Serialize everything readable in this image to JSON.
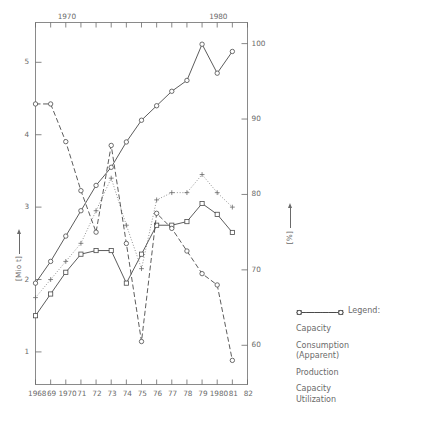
{
  "chart_data": {
    "type": "line",
    "title": "",
    "xlabel": "",
    "ylabel": "[Mio t]",
    "y2label": "[%]",
    "grid": false,
    "legend_position": "right-bottom",
    "legend_title": "Legend:",
    "x": [
      1968,
      1969,
      1970,
      1971,
      1972,
      1973,
      1974,
      1975,
      1976,
      1977,
      1978,
      1979,
      1980,
      1981,
      1982
    ],
    "xtick_labels": [
      "1968",
      "69",
      "1970",
      "71",
      "72",
      "73",
      "74",
      "75",
      "76",
      "77",
      "78",
      "79",
      "1980",
      "81",
      "82"
    ],
    "xtick_labels_top": [
      "",
      "",
      "1970",
      "",
      "",
      "",
      "",
      "",
      "",
      "",
      "",
      "",
      "1980",
      "",
      ""
    ],
    "ylim": [
      0.55,
      5.55
    ],
    "ytick_labels": [
      "1",
      "2",
      "3",
      "4",
      "5"
    ],
    "ytick_values": [
      1,
      2,
      3,
      4,
      5
    ],
    "y2lim": [
      54.8,
      102.8
    ],
    "y2tick_labels": [
      "60",
      "70",
      "80",
      "90",
      "100"
    ],
    "y2tick_values": [
      60,
      70,
      80,
      90,
      100
    ],
    "series": [
      {
        "name": "Capacity",
        "axis": "left",
        "marker": "circle",
        "line": "solid",
        "color": "#4a4a4a",
        "x": [
          1968,
          1969,
          1970,
          1971,
          1972,
          1973,
          1974,
          1975,
          1976,
          1977,
          1978,
          1979,
          1980,
          1981
        ],
        "values": [
          1.95,
          2.25,
          2.6,
          2.95,
          3.3,
          3.55,
          3.9,
          4.2,
          4.4,
          4.6,
          4.75,
          5.25,
          4.85,
          5.15
        ]
      },
      {
        "name": "Consumption (Apparent)",
        "axis": "left",
        "marker": "square",
        "line": "solid",
        "color": "#4a4a4a",
        "x": [
          1968,
          1969,
          1970,
          1971,
          1972,
          1973,
          1974,
          1975,
          1976,
          1977,
          1978,
          1979,
          1980,
          1981
        ],
        "values": [
          1.5,
          1.8,
          2.1,
          2.35,
          2.4,
          2.4,
          1.95,
          2.35,
          2.75,
          2.75,
          2.8,
          3.05,
          2.9,
          2.65
        ]
      },
      {
        "name": "Production",
        "axis": "left",
        "marker": "plus",
        "line": "dotted",
        "color": "#6a6a6a",
        "x": [
          1968,
          1969,
          1970,
          1971,
          1972,
          1973,
          1974,
          1975,
          1976,
          1977,
          1978,
          1979,
          1980,
          1981
        ],
        "values": [
          1.75,
          2.0,
          2.25,
          2.5,
          2.95,
          3.4,
          2.75,
          2.15,
          3.1,
          3.2,
          3.2,
          3.45,
          3.2,
          3.0
        ]
      },
      {
        "name": "Capacity Utilization",
        "axis": "right",
        "marker": "circle",
        "line": "dashed",
        "color": "#4a4a4a",
        "x": [
          1968,
          1969,
          1970,
          1971,
          1972,
          1973,
          1974,
          1975,
          1976,
          1977,
          1978,
          1979,
          1980,
          1981
        ],
        "values": [
          92.0,
          92.0,
          87.0,
          80.5,
          75.0,
          86.5,
          73.5,
          60.5,
          77.5,
          75.5,
          72.5,
          69.5,
          68.0,
          58.0
        ]
      }
    ]
  },
  "legend": {
    "title": "Legend:",
    "items": [
      {
        "label": "Capacity",
        "marker": "circle",
        "line": "solid"
      },
      {
        "label": "Consumption\n(Apparent)",
        "label_line1": "Consumption",
        "label_line2": "(Apparent)",
        "marker": "square",
        "line": "solid"
      },
      {
        "label": "Production",
        "marker": "plus",
        "line": "dotted"
      },
      {
        "label": "Capacity\nUtilization",
        "label_line1": "Capacity",
        "label_line2": "Utilization",
        "marker": "circle",
        "line": "dashed"
      }
    ]
  },
  "axes": {
    "left_title": "[Mio t]",
    "right_title": "[%]"
  }
}
